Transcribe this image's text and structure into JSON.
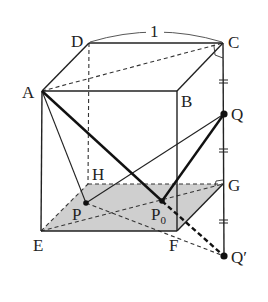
{
  "edge_length_label": "1",
  "colors": {
    "stroke": "#222222",
    "shade": "#cfcfcf",
    "background": "#ffffff"
  },
  "vertices": {
    "A": {
      "label": "A",
      "x": 42,
      "y": 91
    },
    "B": {
      "label": "B",
      "x": 177,
      "y": 91
    },
    "C": {
      "label": "C",
      "x": 223,
      "y": 43
    },
    "D": {
      "label": "D",
      "x": 89,
      "y": 43
    },
    "E": {
      "label": "E",
      "x": 41,
      "y": 231
    },
    "F": {
      "label": "F",
      "x": 177,
      "y": 231
    },
    "G": {
      "label": "G",
      "x": 223,
      "y": 184
    },
    "H": {
      "label": "H",
      "x": 88,
      "y": 184
    }
  },
  "points": {
    "P": {
      "label": "P",
      "x": 86,
      "y": 203
    },
    "P0": {
      "label": "P",
      "subscript": "0",
      "x": 162,
      "y": 201
    },
    "Q": {
      "label": "Q",
      "x": 224,
      "y": 114
    },
    "Qp": {
      "label": "Q′",
      "x": 224,
      "y": 256
    }
  },
  "labels": {
    "A": "A",
    "B": "B",
    "C": "C",
    "D": "D",
    "E": "E",
    "F": "F",
    "G": "G",
    "H": "H",
    "P": "P",
    "P0_main": "P",
    "P0_sub": "0",
    "Q": "Q",
    "Qp": "Q′",
    "edge": "1"
  },
  "annotations": {
    "equal_segment_ticks": [
      "C-Q",
      "Q-G",
      "G-Q'"
    ],
    "shaded_face": "EFGH (bottom face)",
    "right_angle_marks": [
      "C",
      "G"
    ]
  }
}
